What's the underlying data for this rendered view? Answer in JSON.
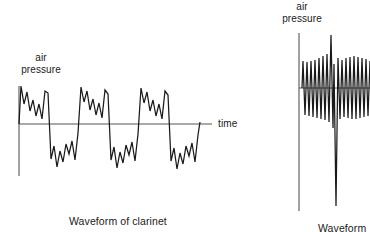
{
  "figure": {
    "background_color": "#ffffff",
    "stroke_color": "#1a1a1a",
    "axis_color": "#555555"
  },
  "left_panel": {
    "y_axis_label": "air\npressure",
    "x_axis_label": "time",
    "caption": "Waveform of clarinet",
    "axis": {
      "origin_x": 19,
      "baseline_y": 124,
      "y_axis_top": 86,
      "y_axis_bottom": 176,
      "x_axis_left": 19,
      "x_axis_right": 212
    },
    "chart_data": {
      "type": "line",
      "title": "Waveform of clarinet",
      "xlabel": "time",
      "ylabel": "air pressure",
      "grid": false,
      "legend": null,
      "xlim": [
        0,
        212
      ],
      "ylim": [
        -50,
        45
      ],
      "points": [
        [
          19,
          0
        ],
        [
          21,
          38
        ],
        [
          24,
          20
        ],
        [
          27,
          32
        ],
        [
          30,
          13
        ],
        [
          33,
          24
        ],
        [
          36,
          8
        ],
        [
          39,
          20
        ],
        [
          42,
          5
        ],
        [
          45,
          33
        ],
        [
          48,
          31
        ],
        [
          51,
          -35
        ],
        [
          54,
          -22
        ],
        [
          57,
          -43
        ],
        [
          60,
          -27
        ],
        [
          63,
          -38
        ],
        [
          66,
          -20
        ],
        [
          69,
          -30
        ],
        [
          72,
          -17
        ],
        [
          75,
          -36
        ],
        [
          78,
          -9
        ],
        [
          81,
          37
        ],
        [
          84,
          22
        ],
        [
          87,
          33
        ],
        [
          90,
          14
        ],
        [
          93,
          25
        ],
        [
          96,
          9
        ],
        [
          99,
          21
        ],
        [
          102,
          6
        ],
        [
          105,
          34
        ],
        [
          108,
          30
        ],
        [
          111,
          -36
        ],
        [
          114,
          -23
        ],
        [
          117,
          -44
        ],
        [
          120,
          -28
        ],
        [
          123,
          -39
        ],
        [
          126,
          -21
        ],
        [
          129,
          -31
        ],
        [
          132,
          -18
        ],
        [
          135,
          -37
        ],
        [
          138,
          -10
        ],
        [
          141,
          36
        ],
        [
          144,
          21
        ],
        [
          147,
          32
        ],
        [
          150,
          13
        ],
        [
          153,
          24
        ],
        [
          156,
          8
        ],
        [
          159,
          20
        ],
        [
          162,
          5
        ],
        [
          165,
          33
        ],
        [
          168,
          29
        ],
        [
          171,
          -37
        ],
        [
          174,
          -24
        ],
        [
          177,
          -45
        ],
        [
          180,
          -29
        ],
        [
          183,
          -40
        ],
        [
          186,
          -22
        ],
        [
          189,
          -32
        ],
        [
          192,
          -19
        ],
        [
          195,
          -38
        ],
        [
          198,
          -11
        ],
        [
          200,
          2
        ]
      ]
    }
  },
  "right_panel": {
    "y_axis_label": "air\npressure",
    "caption": "Waveform",
    "axis": {
      "origin_x": 299,
      "baseline_y": 88,
      "y_axis_top": 33,
      "y_axis_bottom": 211,
      "x_axis_left": 299,
      "x_axis_right": 370
    },
    "chart_data": {
      "type": "line",
      "title": "Waveform",
      "xlabel": "",
      "ylabel": "air pressure",
      "grid": false,
      "legend": null,
      "xlim": [
        299,
        370
      ],
      "ylim": [
        -120,
        55
      ],
      "points": [
        [
          302,
          0
        ],
        [
          303,
          27
        ],
        [
          305,
          -27
        ],
        [
          307,
          26
        ],
        [
          309,
          -28
        ],
        [
          311,
          27
        ],
        [
          313,
          -29
        ],
        [
          315,
          28
        ],
        [
          317,
          -30
        ],
        [
          319,
          30
        ],
        [
          321,
          -31
        ],
        [
          323,
          32
        ],
        [
          325,
          -32
        ],
        [
          327,
          34
        ],
        [
          329,
          -34
        ],
        [
          331,
          53
        ],
        [
          333,
          -40
        ],
        [
          334,
          24
        ],
        [
          336,
          -118
        ],
        [
          338,
          30
        ],
        [
          340,
          -31
        ],
        [
          342,
          28
        ],
        [
          344,
          -29
        ],
        [
          346,
          30
        ],
        [
          348,
          -30
        ],
        [
          350,
          31
        ],
        [
          352,
          -31
        ],
        [
          354,
          32
        ],
        [
          356,
          -31
        ],
        [
          358,
          31
        ],
        [
          360,
          -30
        ],
        [
          362,
          30
        ],
        [
          364,
          -29
        ],
        [
          366,
          29
        ],
        [
          368,
          -28
        ],
        [
          370,
          27
        ]
      ]
    }
  }
}
